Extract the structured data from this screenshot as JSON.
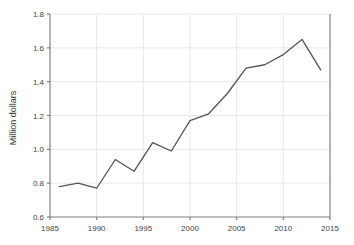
{
  "chart_data": {
    "type": "line",
    "title": "",
    "xlabel": "",
    "ylabel": "Million dollars",
    "xlim": [
      1985,
      2015
    ],
    "ylim": [
      0.6,
      1.8
    ],
    "xticks": [
      1985,
      1990,
      1995,
      2000,
      2005,
      2010,
      2015
    ],
    "yticks": [
      0.6,
      0.8,
      1.0,
      1.2,
      1.4,
      1.6,
      1.8
    ],
    "xtick_labels": [
      "1985",
      "1990",
      "1995",
      "2000",
      "2005",
      "2010",
      "2015"
    ],
    "ytick_labels": [
      "0.6",
      "0.8",
      "1.0",
      "1.2",
      "1.4",
      "1.6",
      "1.8"
    ],
    "grid": true,
    "legend": false,
    "x": [
      1986,
      1988,
      1990,
      1992,
      1994,
      1996,
      1998,
      2000,
      2002,
      2004,
      2006,
      2008,
      2010,
      2012,
      2014
    ],
    "values": [
      0.78,
      0.8,
      0.77,
      0.94,
      0.87,
      1.04,
      0.99,
      1.17,
      1.21,
      1.33,
      1.48,
      1.5,
      1.56,
      1.65,
      1.47
    ],
    "series": [
      {
        "name": "Million dollars",
        "values": [
          0.78,
          0.8,
          0.77,
          0.94,
          0.87,
          1.04,
          0.99,
          1.17,
          1.21,
          1.33,
          1.48,
          1.5,
          1.56,
          1.65,
          1.47
        ]
      }
    ],
    "line_color": "#555555",
    "grid_color": "#e8e8e8",
    "axis_color": "#808080",
    "background": "#ffffff"
  }
}
